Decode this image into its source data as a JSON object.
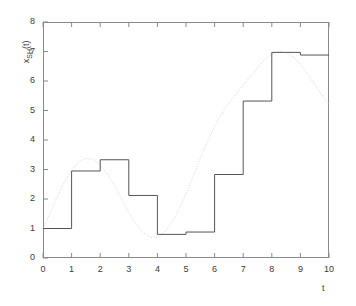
{
  "chart_data": {
    "type": "line",
    "title": "",
    "subtitle": "",
    "xlabel": "t",
    "ylabel_main": "x",
    "ylabel_sub": "SH",
    "ylabel_suffix": "(t)",
    "ylabel_full": "x_SH(t)",
    "xlim": [
      0,
      10
    ],
    "ylim": [
      0,
      8
    ],
    "xticks": [
      0,
      1,
      2,
      3,
      4,
      5,
      6,
      7,
      8,
      9,
      10
    ],
    "yticks": [
      0,
      1,
      2,
      3,
      4,
      5,
      6,
      7,
      8
    ],
    "xtick_labels": [
      "0",
      "1",
      "2",
      "3",
      "4",
      "5",
      "6",
      "7",
      "8",
      "9",
      "10"
    ],
    "ytick_labels": [
      "0",
      "1",
      "2",
      "3",
      "4",
      "5",
      "6",
      "7",
      "8"
    ],
    "grid": false,
    "legend": "none",
    "series": [
      {
        "name": "sample-and-hold-signal",
        "style": "step-post",
        "color": "#555555",
        "linewidth": 1.0,
        "x": [
          0,
          1,
          2,
          3,
          4,
          5,
          6,
          7,
          8,
          9,
          10
        ],
        "values": [
          1.0,
          2.95,
          3.33,
          2.12,
          0.8,
          0.88,
          2.83,
          5.32,
          6.97,
          6.88,
          6.88
        ]
      },
      {
        "name": "continuous-signal",
        "style": "dotted",
        "color": "#d6d6d6",
        "linewidth": 1.0,
        "x": [
          0.0,
          0.25,
          0.5,
          0.75,
          1.0,
          1.25,
          1.5,
          1.75,
          2.0,
          2.25,
          2.5,
          2.75,
          3.0,
          3.25,
          3.5,
          3.75,
          4.0,
          4.25,
          4.5,
          4.75,
          5.0,
          5.25,
          5.5,
          5.75,
          6.0,
          6.25,
          6.5,
          6.75,
          7.0,
          7.25,
          7.5,
          7.75,
          8.0,
          8.25,
          8.5,
          8.75,
          9.0,
          9.25,
          9.5,
          9.75,
          10.0
        ],
        "values": [
          1.0,
          1.53,
          2.08,
          2.58,
          2.99,
          3.26,
          3.38,
          3.34,
          3.16,
          2.85,
          2.45,
          2.0,
          1.55,
          1.15,
          0.86,
          0.71,
          0.71,
          0.88,
          1.19,
          1.64,
          2.17,
          2.77,
          3.37,
          3.95,
          4.46,
          4.89,
          5.25,
          5.56,
          5.86,
          6.15,
          6.45,
          6.72,
          6.92,
          7.0,
          6.97,
          6.82,
          6.57,
          6.24,
          5.88,
          5.52,
          5.2
        ]
      }
    ]
  }
}
